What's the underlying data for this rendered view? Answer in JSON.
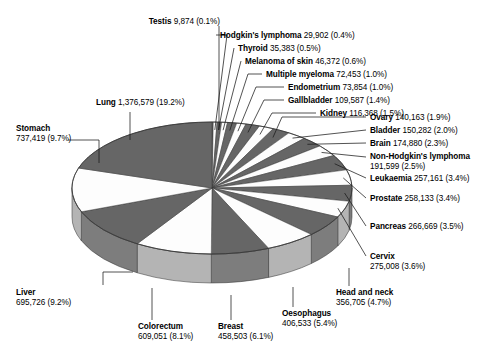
{
  "chart_data": {
    "type": "pie",
    "title": "",
    "xlabel": "",
    "ylabel": "",
    "legend_position": "none",
    "grid": false,
    "style": "3d-pie",
    "label_format": "{name} {value} ({percent})",
    "total": 7170000,
    "categories": [
      "Testis",
      "Hodgkin's lymphoma",
      "Thyroid",
      "Melanoma of skin",
      "Multiple myeloma",
      "Endometrium",
      "Gallbladder",
      "Kidney",
      "Ovary",
      "Bladder",
      "Brain",
      "Non-Hodgkin's lymphoma",
      "Leukaemia",
      "Prostate",
      "Pancreas",
      "Cervix",
      "Head and neck",
      "Oesophagus",
      "Breast",
      "Colorectum",
      "Liver",
      "Stomach",
      "Lung"
    ],
    "values": [
      9874,
      29902,
      35383,
      46372,
      72453,
      73854,
      109587,
      116368,
      140163,
      150282,
      174880,
      191599,
      257161,
      258133,
      266669,
      275008,
      356705,
      406533,
      458503,
      609051,
      695726,
      737419,
      1376579
    ],
    "percents": [
      0.1,
      0.4,
      0.5,
      0.6,
      1.0,
      1.0,
      1.4,
      1.5,
      1.9,
      2.0,
      2.3,
      2.5,
      3.4,
      3.4,
      3.5,
      3.6,
      4.7,
      5.4,
      6.1,
      8.1,
      9.2,
      9.7,
      19.2
    ],
    "slices": [
      {
        "name": "Testis",
        "value": "9,874",
        "percent": "0.1%",
        "value_num": 9874,
        "percent_num": 0.1,
        "fill": "dark"
      },
      {
        "name": "Hodgkin's lymphoma",
        "value": "29,902",
        "percent": "0.4%",
        "value_num": 29902,
        "percent_num": 0.4,
        "fill": "light"
      },
      {
        "name": "Thyroid",
        "value": "35,383",
        "percent": "0.5%",
        "value_num": 35383,
        "percent_num": 0.5,
        "fill": "dark"
      },
      {
        "name": "Melanoma of skin",
        "value": "46,372",
        "percent": "0.6%",
        "value_num": 46372,
        "percent_num": 0.6,
        "fill": "light"
      },
      {
        "name": "Multiple myeloma",
        "value": "72,453",
        "percent": "1.0%",
        "value_num": 72453,
        "percent_num": 1.0,
        "fill": "dark"
      },
      {
        "name": "Endometrium",
        "value": "73,854",
        "percent": "1.0%",
        "value_num": 73854,
        "percent_num": 1.0,
        "fill": "light"
      },
      {
        "name": "Gallbladder",
        "value": "109,587",
        "percent": "1.4%",
        "value_num": 109587,
        "percent_num": 1.4,
        "fill": "dark"
      },
      {
        "name": "Kidney",
        "value": "116,368",
        "percent": "1.5%",
        "value_num": 116368,
        "percent_num": 1.5,
        "fill": "light"
      },
      {
        "name": "Ovary",
        "value": "140,163",
        "percent": "1.9%",
        "value_num": 140163,
        "percent_num": 1.9,
        "fill": "dark"
      },
      {
        "name": "Bladder",
        "value": "150,282",
        "percent": "2.0%",
        "value_num": 150282,
        "percent_num": 2.0,
        "fill": "light"
      },
      {
        "name": "Brain",
        "value": "174,880",
        "percent": "2.3%",
        "value_num": 174880,
        "percent_num": 2.3,
        "fill": "dark"
      },
      {
        "name": "Non-Hodgkin's lymphoma",
        "value": "191,599",
        "percent": "2.5%",
        "value_num": 191599,
        "percent_num": 2.5,
        "fill": "light"
      },
      {
        "name": "Leukaemia",
        "value": "257,161",
        "percent": "3.4%",
        "value_num": 257161,
        "percent_num": 3.4,
        "fill": "dark"
      },
      {
        "name": "Prostate",
        "value": "258,133",
        "percent": "3.4%",
        "value_num": 258133,
        "percent_num": 3.4,
        "fill": "light"
      },
      {
        "name": "Pancreas",
        "value": "266,669",
        "percent": "3.5%",
        "value_num": 266669,
        "percent_num": 3.5,
        "fill": "dark"
      },
      {
        "name": "Cervix",
        "value": "275,008",
        "percent": "3.6%",
        "value_num": 275008,
        "percent_num": 3.6,
        "fill": "light"
      },
      {
        "name": "Head and neck",
        "value": "356,705",
        "percent": "4.7%",
        "value_num": 356705,
        "percent_num": 4.7,
        "fill": "dark"
      },
      {
        "name": "Oesophagus",
        "value": "406,533",
        "percent": "5.4%",
        "value_num": 406533,
        "percent_num": 5.4,
        "fill": "light"
      },
      {
        "name": "Breast",
        "value": "458,503",
        "percent": "6.1%",
        "value_num": 458503,
        "percent_num": 6.1,
        "fill": "dark"
      },
      {
        "name": "Colorectum",
        "value": "609,051",
        "percent": "8.1%",
        "value_num": 609051,
        "percent_num": 8.1,
        "fill": "light"
      },
      {
        "name": "Liver",
        "value": "695,726",
        "percent": "9.2%",
        "value_num": 695726,
        "percent_num": 9.2,
        "fill": "dark"
      },
      {
        "name": "Stomach",
        "value": "737,419",
        "percent": "9.7%",
        "value_num": 737419,
        "percent_num": 9.7,
        "fill": "light"
      },
      {
        "name": "Lung",
        "value": "1,376,579",
        "percent": "19.2%",
        "value_num": 1376579,
        "percent_num": 19.2,
        "fill": "dark"
      }
    ],
    "colors": {
      "dark_slice": "#666666",
      "light_slice": "#fdfdfd",
      "dark_side": "#7d7d7d",
      "light_side": "#b4b4b4",
      "outline": "#3a3a3a",
      "leader_line": "#1a1a1a",
      "text": "#000000",
      "background": "#ffffff"
    },
    "geometry": {
      "center_x": 212,
      "center_y": 188,
      "radius_x": 140,
      "radius_y": 66,
      "depth": 29,
      "start_angle_deg": -90,
      "direction": "clockwise"
    }
  },
  "labels": [
    {
      "id": "testis",
      "name": "Testis",
      "value": "9,874 (0.1%)"
    },
    {
      "id": "hodgkins-lymphoma",
      "name": "Hodgkin's lymphoma",
      "value": "29,902 (0.4%)"
    },
    {
      "id": "thyroid",
      "name": "Thyroid",
      "value": "35,383 (0.5%)"
    },
    {
      "id": "melanoma-of-skin",
      "name": "Melanoma of skin",
      "value": "46,372 (0.6%)"
    },
    {
      "id": "multiple-myeloma",
      "name": "Multiple myeloma",
      "value": "72,453 (1.0%)"
    },
    {
      "id": "endometrium",
      "name": "Endometrium",
      "value": "73,854 (1.0%)"
    },
    {
      "id": "gallbladder",
      "name": "Gallbladder",
      "value": "109,587 (1.4%)"
    },
    {
      "id": "kidney",
      "name": "Kidney",
      "value": "116,368 (1.5%)"
    },
    {
      "id": "ovary",
      "name": "Ovary",
      "value": "140,163 (1.9%)"
    },
    {
      "id": "bladder",
      "name": "Bladder",
      "value": "150,282 (2.0%)"
    },
    {
      "id": "brain",
      "name": "Brain",
      "value": "174,880 (2.3%)"
    },
    {
      "id": "non-hodgkins-lymphoma",
      "name": "Non-Hodgkin's lymphoma",
      "value": "191,599 (2.5%)"
    },
    {
      "id": "leukaemia",
      "name": "Leukaemia",
      "value": "257,161 (3.4%)"
    },
    {
      "id": "prostate",
      "name": "Prostate",
      "value": "258,133 (3.4%)"
    },
    {
      "id": "pancreas",
      "name": "Pancreas",
      "value": "266,669 (3.5%)"
    },
    {
      "id": "cervix",
      "name": "Cervix",
      "value": "275,008 (3.6%)"
    },
    {
      "id": "head-and-neck",
      "name": "Head and neck",
      "value": "356,705 (4.7%)"
    },
    {
      "id": "oesophagus",
      "name": "Oesophagus",
      "value": "406,533 (5.4%)"
    },
    {
      "id": "breast",
      "name": "Breast",
      "value": "458,503 (6.1%)"
    },
    {
      "id": "colorectum",
      "name": "Colorectum",
      "value": "609,051 (8.1%)"
    },
    {
      "id": "liver",
      "name": "Liver",
      "value": "695,726 (9.2%)"
    },
    {
      "id": "stomach",
      "name": "Stomach",
      "value": "737,419 (9.7%)"
    },
    {
      "id": "lung",
      "name": "Lung",
      "value": "1,376,579 (19.2%)"
    }
  ]
}
